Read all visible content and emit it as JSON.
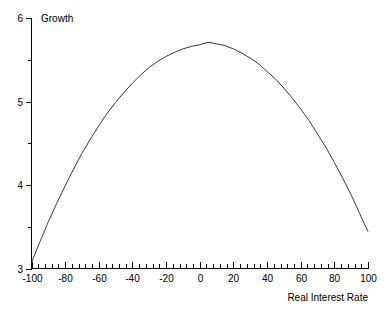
{
  "chart_data": {
    "type": "line",
    "title": "",
    "ylabel": "Growth",
    "xlabel": "Real Interest Rate",
    "xlim": [
      -100,
      100
    ],
    "ylim": [
      3,
      6
    ],
    "grid": false,
    "legend": "none",
    "x_ticks": [
      -100,
      -80,
      -60,
      -40,
      -20,
      0,
      20,
      40,
      60,
      80,
      100
    ],
    "x_tick_labels": [
      "-100",
      "-80",
      "-60",
      "-40",
      "-20",
      "0",
      "20",
      "40",
      "60",
      "80",
      "100"
    ],
    "x_minor_tick_step": 4,
    "y_ticks": [
      3,
      4,
      5,
      6
    ],
    "y_tick_labels": [
      "3",
      "4",
      "5",
      "6"
    ],
    "y_minor_ticks": [
      3.5,
      4.5,
      5.5
    ],
    "series": [
      {
        "name": "Growth",
        "color": "#3a3a3a",
        "description": "Inverted-U (concave quadratic) curve peaking near a real interest rate of 2",
        "peak": {
          "x": 2,
          "y": 5.71
        },
        "x": [
          -100,
          -95,
          -90,
          -85,
          -80,
          -75,
          -70,
          -65,
          -60,
          -55,
          -50,
          -45,
          -40,
          -35,
          -30,
          -25,
          -20,
          -15,
          -10,
          -5,
          0,
          5,
          10,
          15,
          20,
          25,
          30,
          35,
          40,
          45,
          50,
          55,
          60,
          65,
          70,
          75,
          80,
          85,
          90,
          95,
          100
        ],
        "y": [
          3.07,
          3.32,
          3.56,
          3.78,
          3.99,
          4.19,
          4.38,
          4.55,
          4.71,
          4.86,
          4.99,
          5.11,
          5.22,
          5.32,
          5.41,
          5.48,
          5.54,
          5.59,
          5.63,
          5.66,
          5.68,
          5.71,
          5.69,
          5.67,
          5.63,
          5.58,
          5.52,
          5.45,
          5.36,
          5.27,
          5.16,
          5.04,
          4.91,
          4.77,
          4.61,
          4.45,
          4.27,
          4.08,
          3.88,
          3.66,
          3.44
        ]
      }
    ]
  },
  "labels": {
    "y_axis_caption": "Growth",
    "x_axis_caption": "Real Interest Rate"
  },
  "colors": {
    "axis": "#000000",
    "curve": "#3a3a3a",
    "background": "#ffffff",
    "text": "#000000"
  }
}
